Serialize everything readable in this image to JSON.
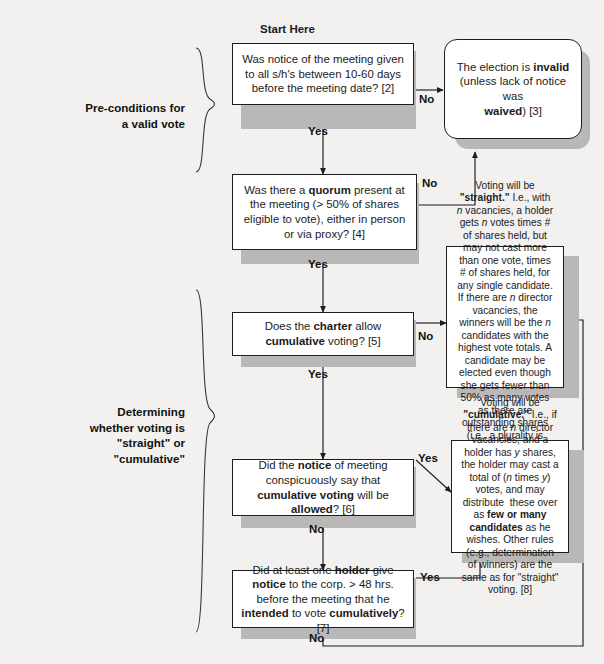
{
  "diagram": {
    "title_label": "Start Here",
    "groups": [
      {
        "name": "pre-conditions",
        "line1": "Pre-conditions for",
        "line2": "a valid vote"
      },
      {
        "name": "determining",
        "line1": "Determining",
        "line2": "whether voting is",
        "line3": "\"straight\" or",
        "line4": "\"cumulative\""
      }
    ],
    "nodes": {
      "notice": {
        "id": "notice-of-meeting-question",
        "text": "Was notice of the meeting given to all s/h's between 10-60 days before the meeting date? [2]",
        "citation": "[2]"
      },
      "invalid": {
        "id": "election-invalid-result",
        "text_pre": "The election is ",
        "text_bold": "invalid",
        "text_mid": "(unless lack of notice was ",
        "text_bold2": "waived",
        "text_post": ") [3]",
        "citation": "[3]"
      },
      "quorum": {
        "id": "quorum-question",
        "text_pre": "Was there a ",
        "text_bold": "quorum",
        "text_post": " present at the meeting (> 50% of shares eligible to vote), either in person or via proxy? [4]",
        "citation": "[4]"
      },
      "charter": {
        "id": "charter-cumulative-question",
        "text_a": "Does the ",
        "text_b": "charter",
        "text_c": " allow ",
        "text_d": "cumulative",
        "text_e": " voting? [5]",
        "citation": "[5]"
      },
      "straight": {
        "id": "straight-voting-result",
        "text": "Voting will be \"straight.\" I.e., with n vacancies, a holder gets n votes times # of shares held, but may not cast more than one vote, times # of shares held, for any single candidate. If there are n director vacancies, the winners will be the n candidates with the highest vote totals. A candidate may be elected even though she gets fewer than 50% as many votes as there are outstanding shares (i.e., a plurality is enough).",
        "keyword": "\"straight.\""
      },
      "noticesays": {
        "id": "notice-says-cumulative-question",
        "text_a": "Did the ",
        "text_b": "notice",
        "text_c": " of meeting conspicuously say that ",
        "text_d": "cumulative voting",
        "text_e": " will be ",
        "text_f": "allowed",
        "text_g": "? [6]",
        "citation": "[6]"
      },
      "cumulative": {
        "id": "cumulative-voting-result",
        "text": "Voting will be \"cumulative.\" I.e., if there are n director vacancies, and a holder has y shares, the holder may cast a total of (n times y) votes, and may distribute these over as few or many candidates as he wishes. Other rules (e.g., determination of winners) are the same as for \"straight\" voting. [8]",
        "keyword": "\"cumulative.\"",
        "citation": "[8]"
      },
      "holder": {
        "id": "holder-gave-notice-question",
        "text_a": "Did at least one ",
        "text_b": "holder",
        "text_c": " give ",
        "text_d": "notice",
        "text_e": " to the corp. > 48 hrs. before the meeting that he ",
        "text_f": "intended",
        "text_g": " to vote ",
        "text_h": "cumulatively",
        "text_i": "? [7]",
        "citation": "[7]"
      }
    },
    "edges": [
      {
        "name": "notice-no",
        "label": "No"
      },
      {
        "name": "notice-yes",
        "label": "Yes"
      },
      {
        "name": "quorum-no",
        "label": "No"
      },
      {
        "name": "quorum-yes",
        "label": "Yes"
      },
      {
        "name": "charter-no",
        "label": "No"
      },
      {
        "name": "charter-yes",
        "label": "Yes"
      },
      {
        "name": "noticesays-yes",
        "label": "Yes"
      },
      {
        "name": "noticesays-no",
        "label": "No"
      },
      {
        "name": "holder-yes",
        "label": "Yes"
      },
      {
        "name": "holder-no",
        "label": "No"
      }
    ],
    "colors": {
      "page_background": "#f2f1ef",
      "node_fill": "#ffffff",
      "node_border": "#1d1d1d",
      "drop_shadow": "#b9b8b6",
      "text": "#1b1b1b"
    }
  }
}
